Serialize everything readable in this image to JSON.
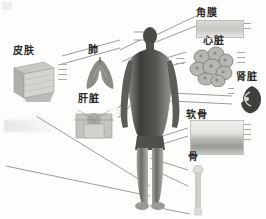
{
  "figure": {
    "background_color": "#fdfdfc",
    "line_color": "#5a5a56",
    "label_color": "#2b2b2b"
  },
  "center": {
    "name": "人体",
    "description": "full-body human silhouette"
  },
  "callouts": [
    {
      "id": "skin",
      "label": "皮肤",
      "english": "Skin",
      "side": "left",
      "specimen": "skin-block-specimen"
    },
    {
      "id": "lung",
      "label": "肺",
      "english": "Lung",
      "side": "left",
      "specimen": "lung-specimen"
    },
    {
      "id": "liver",
      "label": "肝脏",
      "english": "Liver",
      "side": "left",
      "specimen": "liver-specimen"
    },
    {
      "id": "cornea",
      "label": "角膜",
      "english": "Cornea",
      "side": "right",
      "specimen": "cornea-strip-specimen"
    },
    {
      "id": "heart",
      "label": "心脏",
      "english": "Heart",
      "side": "right",
      "specimen": "heart-tissue-specimen"
    },
    {
      "id": "kidney",
      "label": "肾脏",
      "english": "Kidney",
      "side": "right",
      "specimen": "kidney-specimen"
    },
    {
      "id": "cartilage",
      "label": "软骨",
      "english": "Cartilage",
      "side": "right",
      "specimen": "cartilage-strip-specimen"
    },
    {
      "id": "bone",
      "label": "骨",
      "english": "Bone",
      "side": "right",
      "specimen": "bone-specimen"
    }
  ]
}
